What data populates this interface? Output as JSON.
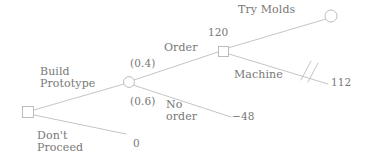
{
  "diagram": {
    "type": "decision-tree",
    "title_text": "",
    "stroke_color": "#b9b9b9",
    "text_color": "#787878",
    "background_color": "#ffffff",
    "nodes": [
      {
        "id": "root",
        "shape": "square",
        "role": "decision",
        "x": 28,
        "y": 112,
        "size": 11,
        "value_label": ""
      },
      {
        "id": "chance1",
        "shape": "circle",
        "role": "chance",
        "x": 129,
        "y": 82,
        "radius": 5.5,
        "value_label": ""
      },
      {
        "id": "decision2",
        "shape": "square",
        "role": "decision",
        "x": 223,
        "y": 51,
        "size": 10,
        "value_label": "120"
      },
      {
        "id": "terminal_try_molds",
        "shape": "circle",
        "role": "chance",
        "x": 331,
        "y": 16,
        "radius": 6,
        "value_label": ""
      }
    ],
    "edges": [
      {
        "id": "build-prototype",
        "label": "Build\nPrototype",
        "from": "root",
        "to": "chance1"
      },
      {
        "id": "dont-proceed",
        "label": "Don't\nProceed",
        "from": "root",
        "to": "payoff_zero",
        "payoff": "0"
      },
      {
        "id": "order",
        "label": "Order",
        "probability": "(0.4)",
        "from": "chance1",
        "to": "decision2"
      },
      {
        "id": "no-order",
        "label": "No\norder",
        "probability": "(0.6)",
        "from": "chance1",
        "to": "payoff_neg48",
        "payoff": "−48"
      },
      {
        "id": "try-molds",
        "label": "Try Molds",
        "from": "decision2",
        "to": "terminal_try_molds"
      },
      {
        "id": "machine",
        "label": "Machine",
        "from": "decision2",
        "to": "payoff_112",
        "payoff": "112",
        "pruned": true,
        "prune_marks": 2
      }
    ],
    "labels": {
      "build_prototype_line1": "Build",
      "build_prototype_line2": "Prototype",
      "dont_proceed_line1": "Don't",
      "dont_proceed_line2": "Proceed",
      "order": "Order",
      "prob_order": "(0.4)",
      "prob_no_order": "(0.6)",
      "no_order_line1": "No",
      "no_order_line2": "order",
      "try_molds": "Try Molds",
      "machine": "Machine",
      "node_value_120": "120",
      "payoff_zero": "0",
      "payoff_neg_48": "−48",
      "payoff_112": "112"
    }
  }
}
